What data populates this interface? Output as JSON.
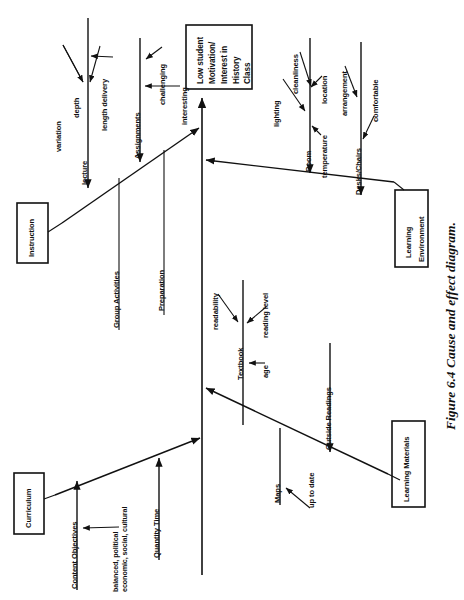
{
  "figure": {
    "caption": "Figure 6.4  Cause and effect diagram.",
    "type": "cause-and-effect-fishbone-diagram",
    "orientation": "rotated-90-counterclockwise"
  },
  "effect": {
    "lines": [
      "Low student",
      "Motivation/",
      "Interest  in",
      "History",
      "Class"
    ],
    "full_text": "Low student Motivation/ Interest in History Class"
  },
  "branches": {
    "instruction": {
      "label": "Instruction",
      "ribs": [
        {
          "label": "lecture",
          "causes": [
            "variation",
            "depth",
            "length delivery"
          ]
        },
        {
          "label": "Assignments",
          "causes": [
            "challenging",
            "interesting"
          ]
        },
        {
          "label": "Group Activities",
          "causes": []
        },
        {
          "label": "Preparation",
          "causes": []
        }
      ]
    },
    "learning_environment": {
      "label_lines": [
        "Learning",
        "Environment"
      ],
      "label": "Learning Environment",
      "ribs": [
        {
          "label": "Room",
          "causes": [
            "lighting",
            "cleanliness",
            "location",
            "temperature"
          ]
        },
        {
          "label": "Desks/Chairs",
          "causes": [
            "arrangement",
            "comfortable"
          ]
        }
      ]
    },
    "curriculum": {
      "label": "Curriculum",
      "ribs": [
        {
          "label": "Content Objectives",
          "causes": [
            "balanced, political",
            "economic, social, cultural"
          ]
        },
        {
          "label": "Quantity Time",
          "causes": []
        }
      ]
    },
    "learning_materials": {
      "label": "Learning  Materials",
      "ribs": [
        {
          "label": "Textbook",
          "causes": [
            "readability",
            "reading  level",
            "age"
          ]
        },
        {
          "label": "Maps",
          "causes": [
            "up to date"
          ]
        },
        {
          "label": "Outside Readings",
          "causes": []
        }
      ]
    }
  },
  "colors": {
    "ink": "#111111",
    "paper": "#ffffff"
  }
}
